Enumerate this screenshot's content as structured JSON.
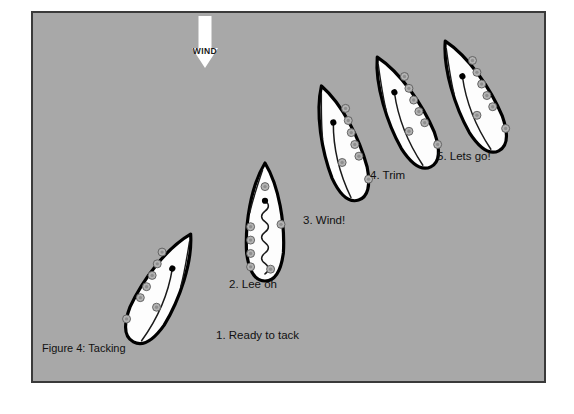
{
  "figure": {
    "caption": "Figure 4: Tacking",
    "caption_x": 42,
    "caption_y": 352,
    "panel": {
      "x": 32,
      "y": 12,
      "width": 513,
      "height": 370,
      "background_color": "#a8a8a8",
      "border_color": "#3a3a3a"
    },
    "page_background": "#ffffff"
  },
  "wind": {
    "label": "WIND",
    "direction": "down",
    "color": "#ffffff",
    "label_color": "#1a1a1a",
    "shaft_x": 205,
    "shaft_top": 16,
    "shaft_bottom": 48,
    "shaft_width": 13,
    "head_half_width": 13,
    "head_tip_y": 68,
    "label_x": 205,
    "label_y": 54
  },
  "style": {
    "hull_fill": "#fdfdfd",
    "hull_stroke": "#000000",
    "crew_fill": "#b3b3b3",
    "crew_stroke": "#5a5a5a",
    "mast_color": "#000000",
    "text_color": "#111111"
  },
  "boats": [
    {
      "id": "boat-1",
      "step": 1,
      "label": "1. Ready to tack",
      "label_x": 216,
      "label_y": 339,
      "heading_deg": 28,
      "center_x": 162,
      "center_y": 288,
      "hull_length": 122,
      "hull_beam": 42,
      "sail_state": "trimmed",
      "mast_x": 158,
      "mast_y": 268,
      "crew_count": 7,
      "crew_side": "starboard"
    },
    {
      "id": "boat-2",
      "step": 2,
      "label": "2. Lee oh",
      "label_x": 229,
      "label_y": 288,
      "heading_deg": 0,
      "center_x": 265,
      "center_y": 222,
      "hull_length": 118,
      "hull_beam": 40,
      "sail_state": "luffing",
      "mast_x": 263,
      "mast_y": 182,
      "crew_count": 7,
      "crew_side": "both"
    },
    {
      "id": "boat-3",
      "step": 3,
      "label": "3. Wind!",
      "label_x": 303,
      "label_y": 224,
      "heading_deg": -18,
      "center_x": 340,
      "center_y": 143,
      "hull_length": 120,
      "hull_beam": 40,
      "sail_state": "crossing",
      "mast_x": 345,
      "mast_y": 122,
      "crew_count": 7,
      "crew_side": "port"
    },
    {
      "id": "boat-4",
      "step": 4,
      "label": "4. Trim",
      "label_x": 370,
      "label_y": 179,
      "heading_deg": -26,
      "center_x": 404,
      "center_y": 112,
      "hull_length": 122,
      "hull_beam": 40,
      "sail_state": "trimmed",
      "mast_x": 412,
      "mast_y": 88,
      "crew_count": 7,
      "crew_side": "port"
    },
    {
      "id": "boat-5",
      "step": 5,
      "label": "5. Lets go!",
      "label_x": 437,
      "label_y": 160,
      "heading_deg": -26,
      "center_x": 472,
      "center_y": 96,
      "hull_length": 122,
      "hull_beam": 40,
      "sail_state": "trimmed",
      "mast_x": 481,
      "mast_y": 72,
      "crew_count": 7,
      "crew_side": "port"
    }
  ]
}
